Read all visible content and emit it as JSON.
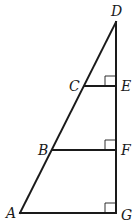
{
  "diagram": {
    "type": "geometry",
    "points": {
      "A": {
        "label": "A",
        "x": 20,
        "y": 213
      },
      "B": {
        "label": "B",
        "x": 52,
        "y": 150
      },
      "C": {
        "label": "C",
        "x": 85,
        "y": 86
      },
      "D": {
        "label": "D",
        "x": 116,
        "y": 22
      },
      "E": {
        "label": "E",
        "x": 116,
        "y": 86
      },
      "F": {
        "label": "F",
        "x": 116,
        "y": 150
      },
      "G": {
        "label": "G",
        "x": 116,
        "y": 213
      }
    },
    "segments": [
      {
        "name": "AD",
        "from": "A",
        "to": "D"
      },
      {
        "name": "DG",
        "from": "D",
        "to": "G"
      },
      {
        "name": "AG",
        "from": "A",
        "to": "G"
      },
      {
        "name": "BF",
        "from": "B",
        "to": "F"
      },
      {
        "name": "CE",
        "from": "C",
        "to": "E"
      }
    ],
    "right_angles": [
      "E",
      "F",
      "G"
    ],
    "labels": {
      "A": "A",
      "B": "B",
      "C": "C",
      "D": "D",
      "E": "E",
      "F": "F",
      "G": "G"
    },
    "colors": {
      "stroke": "#1a1a1a",
      "background": "#ffffff"
    }
  }
}
